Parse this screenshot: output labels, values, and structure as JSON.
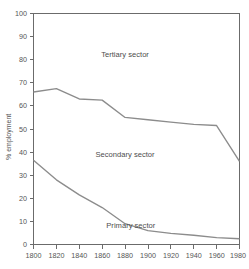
{
  "chart_data": {
    "type": "line",
    "title": "",
    "subtitle": "",
    "xlabel": "",
    "ylabel": "% employment",
    "xlim": [
      1800,
      1980
    ],
    "ylim": [
      0,
      100
    ],
    "grid": false,
    "legend_position": "inline-annotations",
    "x_ticks": [
      1800,
      1820,
      1840,
      1860,
      1880,
      1900,
      1920,
      1940,
      1960,
      1980
    ],
    "y_ticks": [
      0,
      10,
      20,
      30,
      40,
      50,
      60,
      70,
      80,
      90,
      100
    ],
    "x": [
      1800,
      1820,
      1840,
      1860,
      1880,
      1900,
      1920,
      1940,
      1960,
      1980
    ],
    "series": [
      {
        "name": "Tertiary/Secondary boundary",
        "values": [
          66,
          67.5,
          63,
          62.5,
          55,
          54,
          53,
          52,
          51.5,
          36
        ]
      },
      {
        "name": "Secondary/Primary boundary",
        "values": [
          36.5,
          28,
          21.5,
          16,
          9,
          6,
          4.8,
          4,
          3,
          2.5
        ]
      }
    ],
    "annotations": [
      {
        "text": "Tertiary sector",
        "x": 1880,
        "y": 81
      },
      {
        "text": "Secondary sector",
        "x": 1880,
        "y": 38
      },
      {
        "text": "Primary sector",
        "x": 1885,
        "y": 7
      }
    ],
    "colors": {
      "line": "#8c8c8c",
      "axis": "#6b6b6b",
      "text": "#555555",
      "background": "#ffffff"
    }
  },
  "axes": {
    "y_title": "% employment",
    "y_tick_labels": [
      "100",
      "90",
      "80",
      "70",
      "60",
      "50",
      "40",
      "30",
      "20",
      "10",
      "0"
    ],
    "x_tick_labels": [
      "1800",
      "1820",
      "1840",
      "1860",
      "1880",
      "1900",
      "1920",
      "1940",
      "1960",
      "1980"
    ]
  },
  "labels": {
    "tertiary": "Tertiary sector",
    "secondary": "Secondary sector",
    "primary": "Primary sector"
  }
}
